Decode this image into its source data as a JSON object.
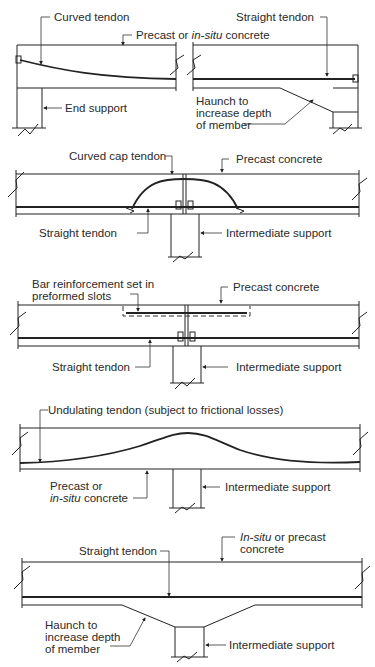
{
  "figure": {
    "panels": [
      {
        "id": "end-and-haunch",
        "labels": {
          "curved_tendon": "Curved tendon",
          "concrete_pre": "Precast or ",
          "concrete_italic": "in-situ",
          "concrete_post": " concrete",
          "straight_tendon": "Straight tendon",
          "end_support": "End support",
          "haunch_1": "Haunch to",
          "haunch_2": "increase depth",
          "haunch_3": "of member"
        }
      },
      {
        "id": "curved-cap-tendon",
        "labels": {
          "curved_cap_tendon": "Curved cap tendon",
          "precast_concrete": "Precast concrete",
          "straight_tendon": "Straight tendon",
          "intermediate_support": "Intermediate support"
        }
      },
      {
        "id": "bar-reinforcement",
        "labels": {
          "bar_1": "Bar reinforcement set in",
          "bar_2": "preformed slots",
          "precast_concrete": "Precast concrete",
          "straight_tendon": "Straight tendon",
          "intermediate_support": "Intermediate support"
        }
      },
      {
        "id": "undulating-tendon",
        "labels": {
          "undulating_tendon": "Undulating tendon (subject to frictional losses)",
          "concrete_1": "Precast or",
          "concrete_italic": "in-situ",
          "concrete_2": " concrete",
          "intermediate_support": "Intermediate support"
        }
      },
      {
        "id": "haunched-intermediate",
        "labels": {
          "concrete_italic": "In-situ",
          "concrete_1": " or precast",
          "concrete_2": "concrete",
          "straight_tendon": "Straight tendon",
          "haunch_1": "Haunch to",
          "haunch_2": "increase depth",
          "haunch_3": "of member",
          "intermediate_support": "Intermediate support"
        }
      }
    ]
  }
}
